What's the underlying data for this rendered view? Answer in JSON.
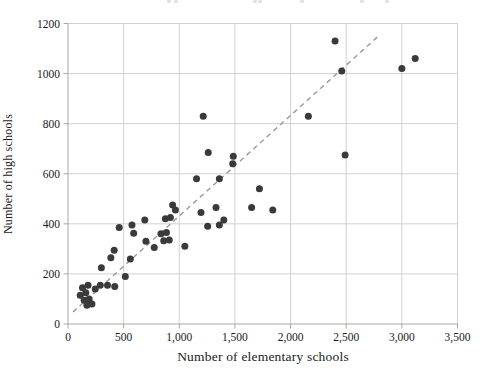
{
  "figure": {
    "cropped_title_fragments_x": [
      167,
      174,
      253,
      258,
      300,
      360,
      385
    ]
  },
  "chart_data": {
    "type": "scatter",
    "title": "",
    "xlabel": "Number of elementary schools",
    "ylabel": "Number of high schools",
    "xlim": [
      0,
      3500
    ],
    "ylim": [
      0,
      1200
    ],
    "grid": true,
    "x_ticks": [
      {
        "value": 0,
        "label": "0"
      },
      {
        "value": 500,
        "label": "500"
      },
      {
        "value": 1000,
        "label": "1,000"
      },
      {
        "value": 1500,
        "label": "1,500"
      },
      {
        "value": 2000,
        "label": "2,000"
      },
      {
        "value": 2500,
        "label": "2,500"
      },
      {
        "value": 3000,
        "label": "3,000"
      },
      {
        "value": 3500,
        "label": "3,500"
      }
    ],
    "y_ticks": [
      {
        "value": 0,
        "label": "0"
      },
      {
        "value": 200,
        "label": "200"
      },
      {
        "value": 400,
        "label": "400"
      },
      {
        "value": 600,
        "label": "600"
      },
      {
        "value": 800,
        "label": "800"
      },
      {
        "value": 1000,
        "label": "1000"
      },
      {
        "value": 1200,
        "label": "1200"
      }
    ],
    "points": [
      [
        110,
        115
      ],
      [
        130,
        145
      ],
      [
        145,
        95
      ],
      [
        160,
        125
      ],
      [
        170,
        75
      ],
      [
        180,
        155
      ],
      [
        190,
        100
      ],
      [
        215,
        80
      ],
      [
        245,
        140
      ],
      [
        290,
        155
      ],
      [
        300,
        225
      ],
      [
        355,
        155
      ],
      [
        385,
        265
      ],
      [
        415,
        295
      ],
      [
        420,
        150
      ],
      [
        460,
        385
      ],
      [
        515,
        190
      ],
      [
        560,
        260
      ],
      [
        575,
        395
      ],
      [
        590,
        362
      ],
      [
        690,
        415
      ],
      [
        700,
        330
      ],
      [
        775,
        305
      ],
      [
        835,
        360
      ],
      [
        860,
        332
      ],
      [
        875,
        420
      ],
      [
        885,
        365
      ],
      [
        910,
        335
      ],
      [
        920,
        425
      ],
      [
        940,
        475
      ],
      [
        965,
        455
      ],
      [
        1050,
        310
      ],
      [
        1155,
        580
      ],
      [
        1195,
        445
      ],
      [
        1215,
        830
      ],
      [
        1255,
        390
      ],
      [
        1260,
        685
      ],
      [
        1330,
        465
      ],
      [
        1360,
        395
      ],
      [
        1360,
        580
      ],
      [
        1400,
        415
      ],
      [
        1480,
        640
      ],
      [
        1485,
        670
      ],
      [
        1650,
        465
      ],
      [
        1720,
        540
      ],
      [
        1840,
        455
      ],
      [
        2160,
        830
      ],
      [
        2400,
        1130
      ],
      [
        2460,
        1010
      ],
      [
        2490,
        675
      ],
      [
        3000,
        1020
      ],
      [
        3120,
        1060
      ]
    ],
    "trend_line": {
      "style": "dashed",
      "x1": 45,
      "y1": 48,
      "x2": 2785,
      "y2": 1148
    },
    "colors": {
      "point": "#3a3a3a",
      "trend": "#999999",
      "grid": "#d2d0cd",
      "axis": "#a9a7a4",
      "text": "#1a1a1a"
    }
  }
}
